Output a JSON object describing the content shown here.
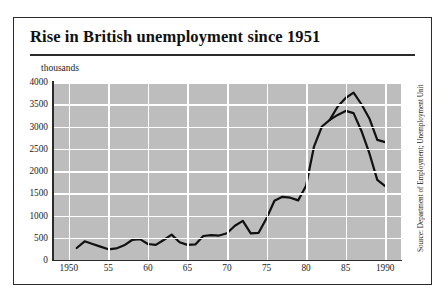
{
  "figure": {
    "title": "Rise in British unemployment since 1951",
    "units_label": "thousands",
    "source": "Source: Department of Employment; Unemployment Unit"
  },
  "chart_data": {
    "type": "line",
    "title": "Rise in British unemployment since 1951",
    "xlabel": "",
    "ylabel": "thousands",
    "xlim": [
      1948,
      1992
    ],
    "ylim": [
      0,
      4000
    ],
    "yticks": [
      0,
      500,
      1000,
      1500,
      2000,
      2500,
      3000,
      3500,
      4000
    ],
    "ytick_labels": [
      "0",
      "500",
      "1000",
      "1500",
      "2000",
      "2500",
      "3000",
      "3500",
      "4000"
    ],
    "xticks": [
      1950,
      1955,
      1960,
      1965,
      1970,
      1975,
      1980,
      1985,
      1990
    ],
    "xtick_labels": [
      "1950",
      "55",
      "60",
      "65",
      "70",
      "75",
      "80",
      "85",
      "1990"
    ],
    "grid": true,
    "legend": "none",
    "plot_background": "#bdbdbd",
    "gridline_color": "#ffffff",
    "line_color": "#111111",
    "series": [
      {
        "name": "Claimant count (headline)",
        "x": [
          1951,
          1952,
          1953,
          1954,
          1955,
          1956,
          1957,
          1958,
          1959,
          1960,
          1961,
          1962,
          1963,
          1964,
          1965,
          1966,
          1967,
          1968,
          1969,
          1970,
          1971,
          1972,
          1973,
          1974,
          1975,
          1976,
          1977,
          1978,
          1979,
          1980,
          1981,
          1982,
          1983,
          1984,
          1985,
          1986,
          1987,
          1988,
          1989,
          1990
        ],
        "values": [
          270,
          420,
          360,
          300,
          240,
          260,
          330,
          450,
          470,
          360,
          340,
          450,
          570,
          400,
          340,
          350,
          540,
          560,
          550,
          600,
          770,
          880,
          600,
          610,
          940,
          1330,
          1420,
          1400,
          1340,
          1670,
          2550,
          3000,
          3150,
          3260,
          3350,
          3300,
          2900,
          2400,
          1800,
          1660
        ]
      },
      {
        "name": "Unemployment Unit (adjusted)",
        "x": [
          1983,
          1984,
          1985,
          1986,
          1987,
          1988,
          1989,
          1990
        ],
        "values": [
          3150,
          3450,
          3640,
          3760,
          3500,
          3180,
          2700,
          2650
        ]
      }
    ]
  }
}
